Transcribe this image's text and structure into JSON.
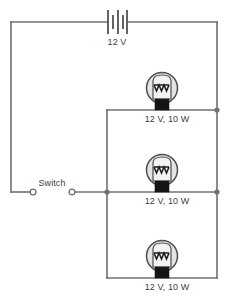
{
  "diagram": {
    "colors": {
      "wire": "#6e7072",
      "bulb_glass": "#e3e3e3",
      "bulb_base": "#151515",
      "filament": "#1b1b1b",
      "label_text": "#3d3f41",
      "background": "#ffffff"
    }
  },
  "battery": {
    "label": "12 V",
    "icon": "battery-symbol",
    "cells": 2
  },
  "switch": {
    "label": "Switch",
    "icon": "open-switch-symbol",
    "state": "open"
  },
  "lamps": [
    {
      "id": "lamp-top",
      "label": "12 V, 10 W",
      "icon": "lamp-symbol"
    },
    {
      "id": "lamp-middle",
      "label": "12 V, 10 W",
      "icon": "lamp-symbol"
    },
    {
      "id": "lamp-bottom",
      "label": "12 V, 10 W",
      "icon": "lamp-symbol"
    }
  ],
  "junctions": [
    {
      "id": "junction-left-branch"
    },
    {
      "id": "junction-right-top"
    },
    {
      "id": "junction-right-middle"
    }
  ]
}
